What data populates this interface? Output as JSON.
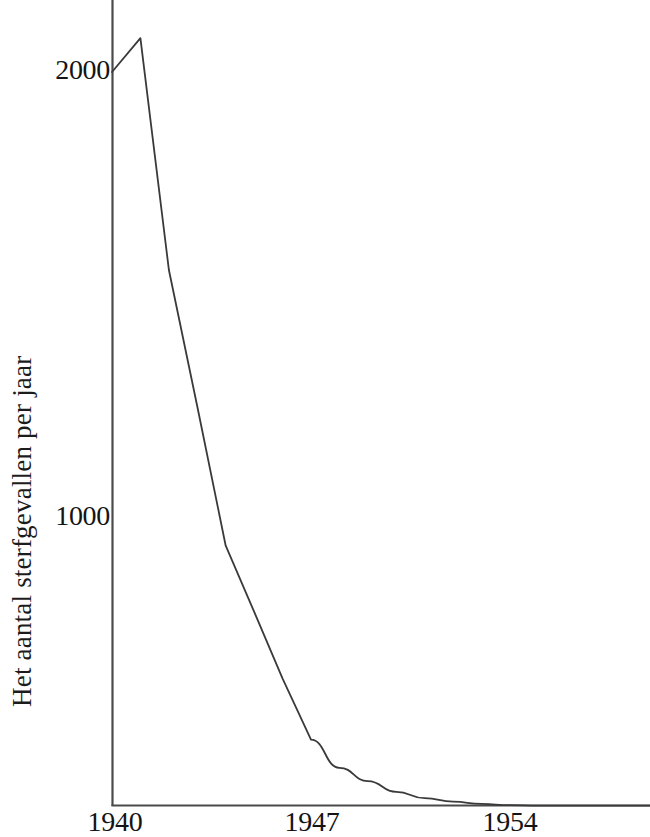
{
  "figure": {
    "background_color": "#ffffff",
    "line_color": "#3a3a3a",
    "axis_color": "#4a4a4a",
    "text_color": "#141414"
  },
  "axes": {
    "ylabel": "Het aantal sterfgevallen per jaar",
    "ytick_labels": [
      "2000",
      "1000"
    ],
    "xtick_labels": [
      "1940",
      "1947",
      "1954"
    ]
  },
  "chart_data": {
    "type": "line",
    "title": "",
    "xlabel": "",
    "ylabel": "Het aantal sterfgevallen per jaar",
    "x": [
      1940,
      1941,
      1942,
      1943,
      1944,
      1945,
      1946,
      1947,
      1948,
      1949,
      1950,
      1951,
      1952,
      1953,
      1954,
      1955
    ],
    "values": [
      2000,
      2076,
      1556,
      1250,
      938,
      790,
      640,
      503,
      440,
      410,
      386,
      372,
      364,
      359,
      356,
      355
    ],
    "series": [
      {
        "name": "Het aantal sterfgevallen per jaar",
        "values": [
          2000,
          2076,
          1556,
          1250,
          938,
          790,
          640,
          503,
          440,
          410,
          386,
          372,
          364,
          359,
          356,
          355
        ]
      }
    ],
    "xlim": [
      1940,
      1959
    ],
    "ylim": [
      355,
      2150
    ],
    "xticks": [
      1940,
      1947,
      1954
    ],
    "yticks": [
      1000,
      2000
    ],
    "grid": false,
    "legend": false,
    "legend_position": "none",
    "annotations": []
  }
}
